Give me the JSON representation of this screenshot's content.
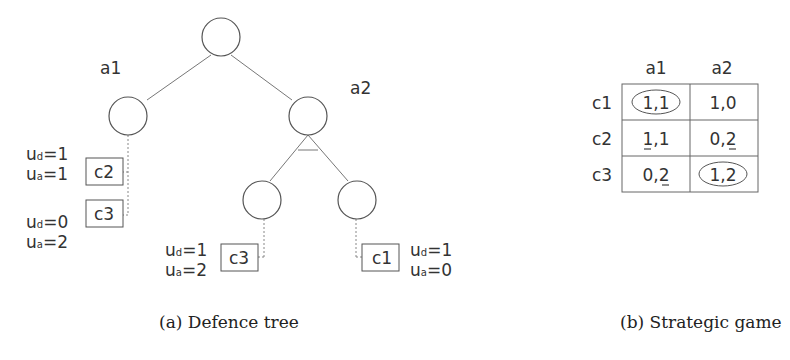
{
  "tree": {
    "edge_labels": {
      "left": "a1",
      "right": "a2"
    },
    "leaves": [
      {
        "id": "c2",
        "label": "c2",
        "ud": "1",
        "ua": "1"
      },
      {
        "id": "c3_left",
        "label": "c3",
        "ud": "0",
        "ua": "2"
      },
      {
        "id": "c3_mid",
        "label": "c3",
        "ud": "1",
        "ua": "2"
      },
      {
        "id": "c1",
        "label": "c1",
        "ud": "1",
        "ua": "0"
      }
    ],
    "caption": "(a) Defence tree"
  },
  "game": {
    "col_headers": [
      "a1",
      "a2"
    ],
    "row_headers": [
      "c1",
      "c2",
      "c3"
    ],
    "cells": [
      [
        "1,1",
        "1,0"
      ],
      [
        "1,1",
        "0,2"
      ],
      [
        "0,2",
        "1,2"
      ]
    ],
    "circled": [
      [
        0,
        0
      ],
      [
        2,
        1
      ]
    ],
    "caption": "(b) Strategic game"
  },
  "util": {
    "ud_prefix": "u",
    "ud_sub": "d",
    "ua_sub": "a"
  }
}
